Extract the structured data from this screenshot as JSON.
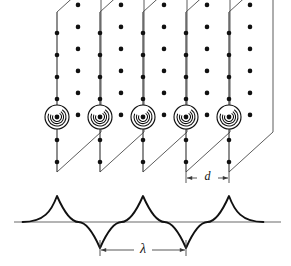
{
  "figure": {
    "background_color": "#ffffff",
    "ink_color": "#111111",
    "line_color": "#4a4a4a",
    "axis_color": "#6b6b6b"
  },
  "labels": {
    "plane_spacing": "d",
    "wavelength": "λ"
  },
  "chart_data": {
    "type": "diagram",
    "planes": {
      "count": 5,
      "shape": "parallelogram",
      "spacing_px": 43,
      "x_edges": [
        57,
        100,
        143,
        186,
        229
      ],
      "top_y": 12,
      "bottom_y": 172,
      "skew_dx": 44,
      "skew_dy": -40,
      "edge_color": "#4a4a4a",
      "vline_color": "#3a3a3a"
    },
    "atoms": {
      "radius_px": 2.3,
      "color": "#111111",
      "edge_rows_y": [
        33,
        55,
        77,
        99,
        140,
        162
      ],
      "interior_offset_x": 21,
      "interior_rows_y": [
        24,
        46,
        68,
        90,
        112,
        134,
        156
      ],
      "description": "staggered dot grid representing atoms on each lattice plane"
    },
    "vortices": {
      "count": 5,
      "center_y": 117,
      "outer_radius_px": 12,
      "arc_radii": [
        9.0,
        6.6,
        4.4
      ],
      "core_radius_px": 2.4,
      "x_positions": [
        57,
        100,
        143,
        186,
        229
      ],
      "description": "concentric spiral arcs with filled core dot, one per plane"
    },
    "wave": {
      "type": "cusped standing wave",
      "axis_y": 222,
      "axis_x_start": 14,
      "axis_x_end": 281,
      "amplitude_px": 26,
      "peaks_x": [
        57,
        143,
        229
      ],
      "troughs_x": [
        100,
        186
      ],
      "wavelength_px": 86,
      "stroke_width": 1.9,
      "color": "#111111"
    },
    "dimensions": [
      {
        "name": "plane-spacing",
        "label": "d",
        "from_x": 186,
        "to_x": 229,
        "y": 178,
        "value_px": 43,
        "arrow_style": "outward",
        "meaning": "separation between adjacent lattice planes"
      },
      {
        "name": "wavelength",
        "label": "λ",
        "from_x": 100,
        "to_x": 186,
        "y": 250,
        "value_px": 86,
        "arrow_style": "inward-double-headed",
        "meaning": "wavelength of the standing wave, equal to twice the plane spacing"
      }
    ],
    "annotations": [
      "Wave peaks align with lattice planes 1, 3 and 5",
      "Wave troughs align with lattice planes 2 and 4",
      "λ = 2d"
    ],
    "grid": false,
    "legend": false
  }
}
